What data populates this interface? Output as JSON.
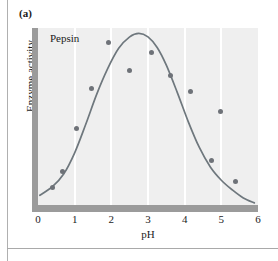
{
  "figure": {
    "panel_label": "(a)",
    "series_label": "Pepsin"
  },
  "axes": {
    "x_title": "pH",
    "y_title": "Enzyme activity",
    "x_ticks": [
      "0",
      "1",
      "2",
      "3",
      "4",
      "5",
      "6"
    ]
  },
  "colors": {
    "plot_background": "#efefef",
    "axis_bar": "#9b9b9b",
    "gridline": "#ffffff",
    "curve": "#6e777d",
    "point": "#6e7278",
    "text": "#1c1c1c",
    "page_rule": "#adadad"
  },
  "chart_data": {
    "type": "scatter",
    "title": "Pepsin",
    "xlabel": "pH",
    "ylabel": "Enzyme activity",
    "xlim": [
      0,
      6
    ],
    "ylim": [
      0,
      1
    ],
    "grid": true,
    "gridlines_x": [
      1,
      2,
      3,
      4,
      5
    ],
    "legend_position": "none",
    "y_axis_ticks_shown": false,
    "x_tick_values": [
      0,
      1,
      2,
      3,
      4,
      5,
      6
    ],
    "points": [
      {
        "x": 0.4,
        "y": 0.1
      },
      {
        "x": 0.68,
        "y": 0.19
      },
      {
        "x": 1.05,
        "y": 0.43
      },
      {
        "x": 1.47,
        "y": 0.66
      },
      {
        "x": 1.92,
        "y": 0.92
      },
      {
        "x": 2.5,
        "y": 0.76
      },
      {
        "x": 3.1,
        "y": 0.86
      },
      {
        "x": 3.62,
        "y": 0.73
      },
      {
        "x": 4.17,
        "y": 0.64
      },
      {
        "x": 4.98,
        "y": 0.53
      },
      {
        "x": 4.72,
        "y": 0.25
      },
      {
        "x": 5.38,
        "y": 0.13
      }
    ],
    "fitted_curve": {
      "description": "bell-shaped optimum curve",
      "peak_x": 2.7,
      "peak_y": 0.97,
      "points": [
        {
          "x": 0.05,
          "y": 0.055
        },
        {
          "x": 0.4,
          "y": 0.105
        },
        {
          "x": 0.7,
          "y": 0.175
        },
        {
          "x": 1.0,
          "y": 0.295
        },
        {
          "x": 1.3,
          "y": 0.455
        },
        {
          "x": 1.6,
          "y": 0.625
        },
        {
          "x": 1.9,
          "y": 0.77
        },
        {
          "x": 2.2,
          "y": 0.885
        },
        {
          "x": 2.5,
          "y": 0.95
        },
        {
          "x": 2.75,
          "y": 0.97
        },
        {
          "x": 3.0,
          "y": 0.95
        },
        {
          "x": 3.25,
          "y": 0.89
        },
        {
          "x": 3.5,
          "y": 0.79
        },
        {
          "x": 3.8,
          "y": 0.635
        },
        {
          "x": 4.1,
          "y": 0.47
        },
        {
          "x": 4.4,
          "y": 0.325
        },
        {
          "x": 4.7,
          "y": 0.215
        },
        {
          "x": 5.0,
          "y": 0.14
        },
        {
          "x": 5.3,
          "y": 0.085
        },
        {
          "x": 5.6,
          "y": 0.04
        },
        {
          "x": 5.9,
          "y": 0.012
        }
      ]
    }
  }
}
